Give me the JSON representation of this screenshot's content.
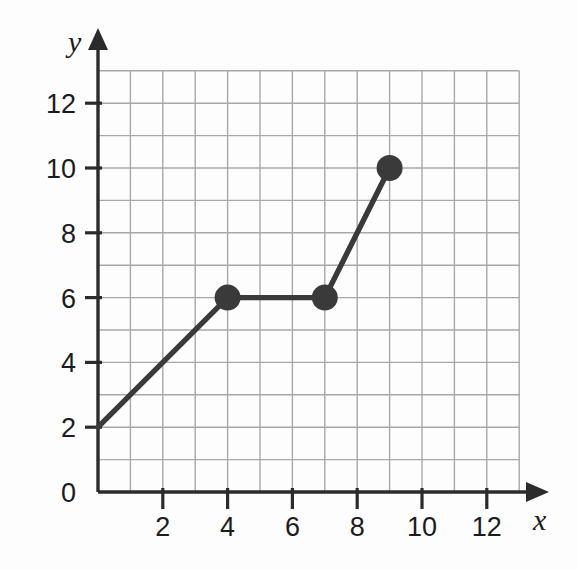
{
  "chart_data": {
    "type": "line",
    "title": "",
    "subtitle": "",
    "xlabel": "x",
    "ylabel": "y",
    "xlim": [
      0,
      13
    ],
    "ylim": [
      0,
      13
    ],
    "grid": true,
    "grid_step": 1,
    "legend": "none",
    "x_ticks": [
      0,
      2,
      4,
      6,
      8,
      10,
      12
    ],
    "y_ticks": [
      0,
      2,
      4,
      6,
      8,
      10,
      12
    ],
    "x_tick_labels": [
      "0",
      "2",
      "4",
      "6",
      "8",
      "10",
      "12"
    ],
    "y_tick_labels": [
      "0",
      "2",
      "4",
      "6",
      "8",
      "10",
      "12"
    ],
    "origin_label": "0",
    "series": [
      {
        "name": "segment-graph",
        "x": [
          0,
          4,
          7,
          9
        ],
        "y": [
          2,
          6,
          6,
          10
        ],
        "marked_points": [
          {
            "x": 4,
            "y": 6
          },
          {
            "x": 7,
            "y": 6
          },
          {
            "x": 9,
            "y": 10
          }
        ],
        "line_color": "#3a3a3a",
        "marker_color": "#3a3a3a",
        "marker_radius": 13
      }
    ],
    "colors": {
      "grid": "#a8a8a8",
      "axis": "#2b2b2b",
      "line": "#3a3a3a",
      "text": "#1c1c1c",
      "background": "#fdfdfd"
    }
  },
  "axis_labels": {
    "x_axis_name": "x",
    "y_axis_name": "y",
    "origin": "0"
  }
}
